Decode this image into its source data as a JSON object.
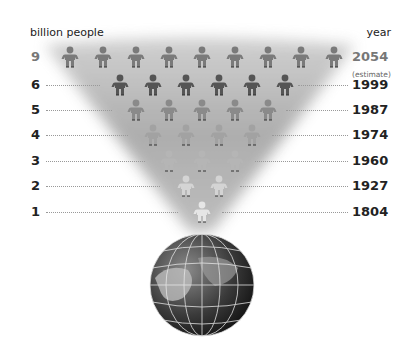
{
  "header": {
    "left_label": "billion people",
    "right_label": "year"
  },
  "rows": [
    {
      "billions": "9",
      "year": "2054",
      "note": "(estimate)",
      "figures": 9,
      "y": 47,
      "shade": "#7a7a7a",
      "dots_left_end": 0,
      "dots_right_start": 0
    },
    {
      "billions": "6",
      "year": "1999",
      "note": "",
      "figures": 6,
      "y": 75,
      "shade": "#555555",
      "dots_left_end": 100,
      "dots_right_start": 298
    },
    {
      "billions": "5",
      "year": "1987",
      "note": "",
      "figures": 5,
      "y": 100,
      "shade": "#8a8a8a",
      "dots_left_end": 112,
      "dots_right_start": 286
    },
    {
      "billions": "4",
      "year": "1974",
      "note": "",
      "figures": 4,
      "y": 125,
      "shade": "#a2a2a2",
      "dots_left_end": 128,
      "dots_right_start": 272
    },
    {
      "billions": "3",
      "year": "1960",
      "note": "",
      "figures": 3,
      "y": 151,
      "shade": "#b5b5b5",
      "dots_left_end": 145,
      "dots_right_start": 255
    },
    {
      "billions": "2",
      "year": "1927",
      "note": "",
      "figures": 2,
      "y": 176,
      "shade": "#d4d4d4",
      "dots_left_end": 160,
      "dots_right_start": 240
    },
    {
      "billions": "1",
      "year": "1804",
      "note": "",
      "figures": 1,
      "y": 202,
      "shade": "#e6e6e6",
      "dots_left_end": 178,
      "dots_right_start": 222
    }
  ],
  "globe": {
    "icon": "earth-globe-icon"
  },
  "chart_data": {
    "type": "pictogram",
    "xlabel": "year",
    "ylabel": "billion people",
    "categories": [
      "1804",
      "1927",
      "1960",
      "1974",
      "1987",
      "1999",
      "2054 (estimate)"
    ],
    "values": [
      1,
      2,
      3,
      4,
      5,
      6,
      9
    ]
  }
}
